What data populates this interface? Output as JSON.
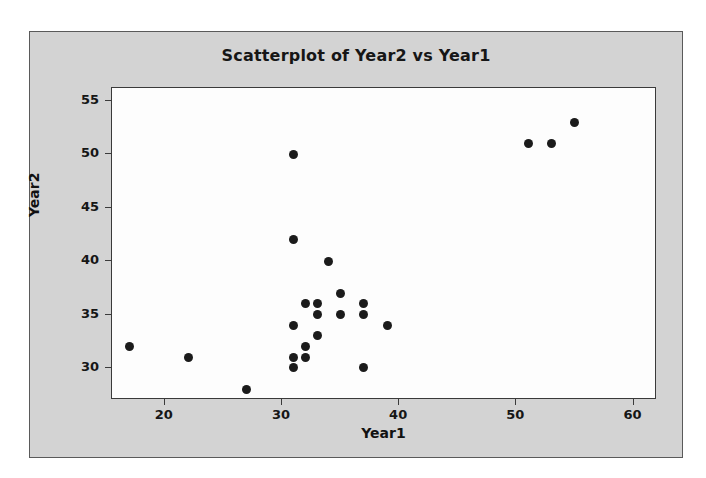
{
  "chart_data": {
    "type": "scatter",
    "title": "Scatterplot of Year2 vs Year1",
    "xlabel": "Year1",
    "ylabel": "Year2",
    "xlim": [
      15.5,
      62.0
    ],
    "ylim": [
      27.0,
      56.2
    ],
    "xticks": [
      20,
      30,
      40,
      50,
      60
    ],
    "yticks": [
      30,
      35,
      40,
      45,
      50,
      55
    ],
    "grid": false,
    "legend": null,
    "marker": "filled-circle",
    "marker_color": "#1b1b1b",
    "plot_background": "#fdfdfd",
    "figure_background": "#d3d3d3",
    "points": [
      {
        "x": 17,
        "y": 32
      },
      {
        "x": 22,
        "y": 31
      },
      {
        "x": 27,
        "y": 28
      },
      {
        "x": 31,
        "y": 50
      },
      {
        "x": 31,
        "y": 42
      },
      {
        "x": 31,
        "y": 34
      },
      {
        "x": 31,
        "y": 31
      },
      {
        "x": 31,
        "y": 30
      },
      {
        "x": 32,
        "y": 36
      },
      {
        "x": 32,
        "y": 32
      },
      {
        "x": 32,
        "y": 31
      },
      {
        "x": 33,
        "y": 36
      },
      {
        "x": 33,
        "y": 35
      },
      {
        "x": 33,
        "y": 33
      },
      {
        "x": 34,
        "y": 40
      },
      {
        "x": 35,
        "y": 37
      },
      {
        "x": 35,
        "y": 35
      },
      {
        "x": 37,
        "y": 36
      },
      {
        "x": 37,
        "y": 35
      },
      {
        "x": 37,
        "y": 30
      },
      {
        "x": 39,
        "y": 34
      },
      {
        "x": 51,
        "y": 51
      },
      {
        "x": 53,
        "y": 51
      },
      {
        "x": 55,
        "y": 53
      }
    ]
  }
}
